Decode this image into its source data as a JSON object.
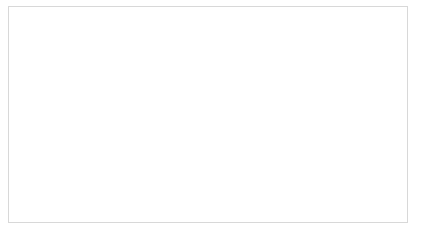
{
  "figure": {
    "background_color": "#ffffff",
    "frame_color": "#d8d8d8",
    "axis_color": "#3a3a3a",
    "line_color": "#2f2f2f"
  },
  "chart_data": {
    "type": "line",
    "title": "",
    "xlabel": "Number of used traces while the analysis",
    "ylabel": "Number of wrong predictions [byte]",
    "xlim": [
      0,
      5000
    ],
    "ylim": [
      0,
      16
    ],
    "xticks": [
      0,
      500,
      1000,
      1500,
      2000,
      2500,
      3000,
      3500,
      4000,
      4500,
      5000
    ],
    "xtick_labels": [
      "0",
      "500",
      "1000",
      "1500",
      "2000",
      "2500",
      "3000",
      "3500",
      "4000",
      "4500",
      "5000"
    ],
    "yticks": [
      0,
      2,
      4,
      6,
      8,
      10,
      12,
      14,
      16
    ],
    "ytick_labels": [
      "0",
      "2",
      "4",
      "6",
      "8",
      "10",
      "12",
      "14",
      "16"
    ],
    "grid": false,
    "legend": null,
    "drawstyle": "steps-post",
    "series": [
      {
        "name": "wrong predictions",
        "x": [
          0,
          200,
          230,
          300,
          520,
          560,
          600,
          780,
          870,
          1200,
          1270,
          1330,
          1400,
          1480,
          1900,
          1960,
          2010,
          2450,
          2500,
          3480,
          3520,
          5000
        ],
        "values": [
          0,
          0,
          2,
          3,
          3,
          4,
          6,
          7,
          8,
          8,
          9,
          10,
          11,
          12,
          12,
          13,
          14,
          14,
          15,
          15,
          16,
          16
        ]
      }
    ]
  }
}
